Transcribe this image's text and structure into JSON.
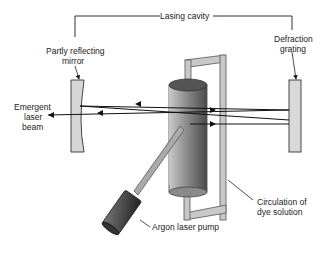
{
  "diagram": {
    "labels": {
      "lasing_cavity": "Lasing cavity",
      "mirror_line1": "Partly reflecting",
      "mirror_line2": "mirror",
      "grating_line1": "Defraction",
      "grating_line2": "grating",
      "beam_line1": "Emergent",
      "beam_line2": "laser",
      "beam_line3": "beam",
      "pump": "Argon laser pump",
      "circulation_line1": "Circulation of",
      "circulation_line2": "dye solution"
    },
    "components": [
      "partly-reflecting-mirror",
      "dye-cell-cylinder",
      "dye-circulation-loop",
      "diffraction-grating",
      "argon-laser-pump",
      "laser-beams"
    ],
    "colors": {
      "line": "#222222",
      "mirror_fill": "#d6d6d6",
      "grating_fill": "#d9d9d9",
      "cylinder_dark": "#555555",
      "cylinder_light": "#e0e0e0",
      "pump_dark": "#2a2a2a",
      "tube_fill": "#c8c8c8"
    }
  }
}
